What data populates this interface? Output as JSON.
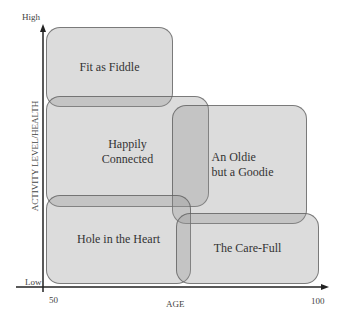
{
  "axes": {
    "y_label": "ACTIVITY LEVEL/HEALTH",
    "y_high": "High",
    "y_low": "Low",
    "x_label": "AGE",
    "x_min": "50",
    "x_max": "100"
  },
  "segments": [
    {
      "id": "fit-as-fiddle",
      "label": "Fit as Fiddle"
    },
    {
      "id": "happily-connected",
      "label_line1": "Happily",
      "label_line2": "Connected"
    },
    {
      "id": "oldie-goodie",
      "label_line1": "An Oldie",
      "label_line2": "but a Goodie"
    },
    {
      "id": "hole-in-heart",
      "label": "Hole in the Heart"
    },
    {
      "id": "care-full",
      "label": "The Care-Full"
    }
  ]
}
